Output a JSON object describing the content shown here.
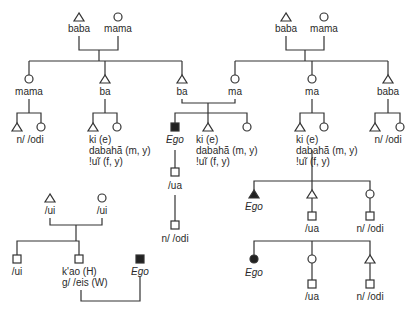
{
  "diagram": {
    "type": "kinship",
    "line_color": "#333333",
    "panel_top_left": {
      "grandfather": "baba",
      "grandmother": "mama",
      "aunt": "mama",
      "uncle": "ba",
      "father": "ba",
      "aunt_children": "n/ /odi",
      "uncle_children": [
        "ki (e)",
        "dabahã (m, y)",
        "!uĩ (f, y)"
      ]
    },
    "panel_top_right": {
      "grandfather": "baba",
      "grandmother": "mama",
      "mother": "ma",
      "aunt": "ma",
      "uncle": "baba",
      "aunt_children": [
        "ki (e)",
        "dabahã (m, y)",
        "!uĩ (f, y)"
      ],
      "uncle_children": "n/ /odi"
    },
    "center": {
      "ego": "Ego",
      "siblings": [
        "ki (e)",
        "dabahã (m, y)",
        "!uĩ (f, y)"
      ],
      "child": "/ua",
      "grandchild": "n/ /odi"
    },
    "panel_bottom_left": {
      "father": "/ui",
      "mother": "/ui",
      "child1": "/ui",
      "child2_line1": "k'ao (H)",
      "child2_line2": "g/ /eis (W)",
      "ego": "Ego"
    },
    "panel_mid_right": {
      "ego": "Ego",
      "brother_child": "/ua",
      "sister_child": "n/ /odi"
    },
    "panel_bottom_right": {
      "ego": "Ego",
      "sister_child": "/ua",
      "brother_child": "n/ /odi"
    }
  }
}
